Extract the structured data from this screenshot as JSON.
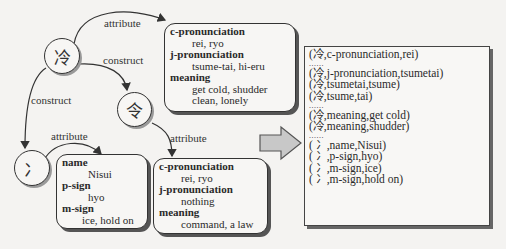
{
  "nodes": {
    "rei": {
      "glyph": "冷"
    },
    "ryo": {
      "glyph": "令"
    },
    "nisui": {
      "glyph": "冫"
    }
  },
  "edge_labels": {
    "rei_attribute": "attribute",
    "rei_construct_ryo": "construct",
    "rei_construct_nisui": "construct",
    "nisui_attribute": "attribute",
    "ryo_attribute": "attribute"
  },
  "cards": {
    "rei": {
      "items": [
        {
          "key": "c-pronunciation",
          "values": [
            "rei, ryo"
          ]
        },
        {
          "key": "j-pronunciation",
          "values": [
            "tsume-tai, hi-eru"
          ]
        },
        {
          "key": "meaning",
          "values": [
            "get cold, shudder",
            "clean, lonely"
          ]
        }
      ]
    },
    "nisui": {
      "items": [
        {
          "key": "name",
          "values": [
            "Nisui"
          ]
        },
        {
          "key": "p-sign",
          "values": [
            "hyo"
          ]
        },
        {
          "key": "m-sign",
          "values": [
            "ice, hold on"
          ]
        }
      ]
    },
    "ryo": {
      "items": [
        {
          "key": "c-pronunciation",
          "values": [
            "rei, ryo"
          ]
        },
        {
          "key": "j-pronunciation",
          "values": [
            "nothing"
          ]
        },
        {
          "key": "meaning",
          "values": [
            "command, a law"
          ]
        }
      ]
    }
  },
  "triples": {
    "rows": [
      "(冷,c-pronunciation,rei)",
      "......",
      "(冷,j-pronunciation,tsumetai)",
      "(冷,tsumetai,tsume)",
      "(冷,tsume,tai)",
      "......",
      "(冷,meaning,get cold)",
      "(冷,meaning,shudder)",
      "......",
      "( 冫,name,Nisui)",
      "( 冫,p-sign,hyo)",
      "( 冫,m-sign,ice)",
      "( 冫,m-sign,hold on)"
    ]
  },
  "colors": {
    "line": "#333333",
    "arrow_fill": "#c8c8c8",
    "background": "#f4f3f1"
  }
}
